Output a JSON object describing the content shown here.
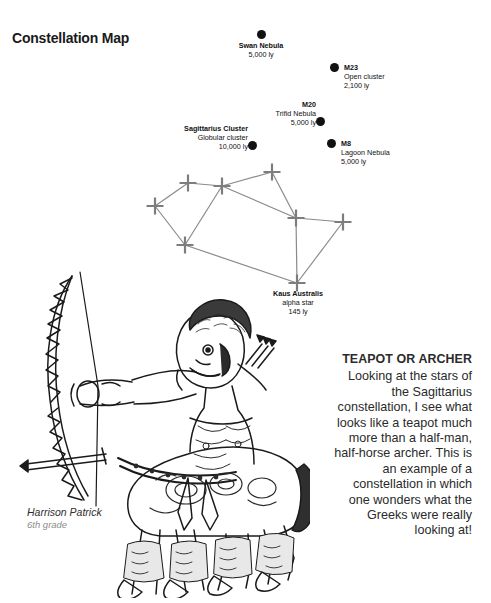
{
  "page": {
    "title": "Constellation Map",
    "background": "#ffffff",
    "ink": "#111111"
  },
  "objects": [
    {
      "id": "swan-nebula",
      "name": "Swan Nebula",
      "subtitle": "",
      "distance": "5,000 ly",
      "marker": "filled-circle",
      "marker_x": 261,
      "marker_y": 34,
      "label_x": 219,
      "label_y": 41,
      "label_w": 84,
      "align": "center"
    },
    {
      "id": "m23",
      "name": "M23",
      "subtitle": "Open cluster",
      "distance": "2,100 ly",
      "marker": "filled-circle",
      "marker_x": 334,
      "marker_y": 67,
      "label_x": 344,
      "label_y": 63,
      "label_w": 80,
      "align": "left"
    },
    {
      "id": "m20",
      "name": "M20",
      "subtitle": "Trifid Nebula",
      "distance": "5,000 ly",
      "marker": "filled-circle",
      "marker_x": 320,
      "marker_y": 121,
      "label_x": 248,
      "label_y": 100,
      "label_w": 68,
      "align": "right"
    },
    {
      "id": "sagittarius-cluster",
      "name": "Sagittarius Cluster",
      "subtitle": "Globular cluster",
      "distance": "10,000 ly",
      "marker": "filled-circle",
      "marker_x": 252,
      "marker_y": 145,
      "label_x": 168,
      "label_y": 124,
      "label_w": 80,
      "align": "right"
    },
    {
      "id": "m8",
      "name": "M8",
      "subtitle": "Lagoon Nebula",
      "distance": "5,000 ly",
      "marker": "filled-circle",
      "marker_x": 331,
      "marker_y": 143,
      "label_x": 341,
      "label_y": 139,
      "label_w": 82,
      "align": "left"
    },
    {
      "id": "kaus-australis",
      "name": "Kaus Australis",
      "subtitle": "alpha star",
      "distance": "145 ly",
      "marker": "none",
      "marker_x": 297,
      "marker_y": 283,
      "label_x": 256,
      "label_y": 289,
      "label_w": 84,
      "align": "center"
    }
  ],
  "constellation": {
    "line_color": "#8a8a8a",
    "star_color": "#7d7d7d",
    "stars": [
      {
        "id": "star-west",
        "x": 155,
        "y": 206
      },
      {
        "id": "star-upper-left",
        "x": 188,
        "y": 183
      },
      {
        "id": "star-top-center",
        "x": 222,
        "y": 186
      },
      {
        "id": "star-top-right",
        "x": 272,
        "y": 172
      },
      {
        "id": "star-mid-right",
        "x": 296,
        "y": 218
      },
      {
        "id": "star-far-east",
        "x": 343,
        "y": 222
      },
      {
        "id": "star-lower-left",
        "x": 185,
        "y": 245
      },
      {
        "id": "star-kaus",
        "x": 297,
        "y": 283
      }
    ],
    "links": [
      [
        "star-west",
        "star-upper-left"
      ],
      [
        "star-upper-left",
        "star-top-center"
      ],
      [
        "star-top-center",
        "star-top-right"
      ],
      [
        "star-top-right",
        "star-mid-right"
      ],
      [
        "star-top-center",
        "star-mid-right"
      ],
      [
        "star-west",
        "star-lower-left"
      ],
      [
        "star-top-center",
        "star-lower-left"
      ],
      [
        "star-mid-right",
        "star-far-east"
      ],
      [
        "star-mid-right",
        "star-kaus"
      ],
      [
        "star-far-east",
        "star-kaus"
      ],
      [
        "star-lower-left",
        "star-kaus"
      ]
    ]
  },
  "caption": {
    "heading": "TEAPOT OR ARCHER",
    "body": "Looking at the stars of the Sagittarius constellation, I see what looks like a teapot much more than a half-man, half-horse archer. This is an example of a constellation in which one wonders what the Greeks were really looking at!"
  },
  "signature": {
    "name": "Harrison Patrick",
    "grade": "6th grade"
  },
  "illustration": {
    "alt": "hand-drawn centaur archer holding a bow",
    "ink": "#1a1a1a"
  }
}
